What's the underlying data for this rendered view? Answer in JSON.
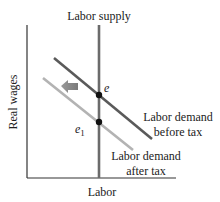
{
  "diagram": {
    "axes": {
      "x_label": "Labor",
      "y_label": "Real wages"
    },
    "curves": {
      "supply": {
        "label": "Labor supply",
        "color": "#6b6b6b"
      },
      "demand_before": {
        "label_line1": "Labor demand",
        "label_line2": "before tax",
        "color": "#5a5a5a"
      },
      "demand_after": {
        "label_line1": "Labor demand",
        "label_line2": "after tax",
        "color": "#b3b3b3"
      }
    },
    "points": {
      "e": {
        "label": "e"
      },
      "e1": {
        "label": "e",
        "subscript": "1"
      }
    },
    "shift_arrow": {
      "direction": "left",
      "color": "#8a8a8a"
    }
  }
}
